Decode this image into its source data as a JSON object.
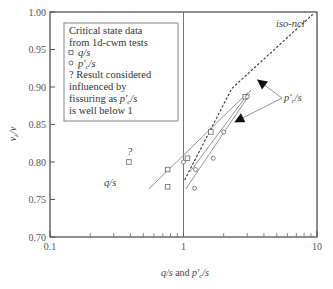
{
  "chart_data": {
    "type": "scatter",
    "title": "",
    "xlabel": "q/s and p'c/s",
    "ylabel": "vλ/v",
    "xscale": "log",
    "xlim": [
      0.1,
      10
    ],
    "ylim": [
      0.7,
      1.0
    ],
    "x_ticks": [
      {
        "value": 0.1,
        "label": "0.1"
      },
      {
        "value": 1,
        "label": "1"
      },
      {
        "value": 10,
        "label": "10"
      }
    ],
    "y_ticks": [
      {
        "value": 0.7,
        "label": "0.70"
      },
      {
        "value": 0.75,
        "label": "0.75"
      },
      {
        "value": 0.8,
        "label": "0.80"
      },
      {
        "value": 0.85,
        "label": "0.85"
      },
      {
        "value": 0.9,
        "label": "0.90"
      },
      {
        "value": 0.95,
        "label": "0.95"
      },
      {
        "value": 1.0,
        "label": "1.00"
      }
    ],
    "grid": false,
    "reference_lines": [
      {
        "axis": "x",
        "value": 1
      }
    ],
    "series": [
      {
        "name": "q/s",
        "marker": "square",
        "points": [
          {
            "x": 0.39,
            "y": 0.8,
            "flag": "?"
          },
          {
            "x": 0.76,
            "y": 0.79
          },
          {
            "x": 0.76,
            "y": 0.767
          },
          {
            "x": 1.07,
            "y": 0.805
          },
          {
            "x": 1.6,
            "y": 0.84
          },
          {
            "x": 2.9,
            "y": 0.887
          }
        ]
      },
      {
        "name": "p'c/s",
        "marker": "circle",
        "points": [
          {
            "x": 1.0,
            "y": 0.8
          },
          {
            "x": 1.23,
            "y": 0.79
          },
          {
            "x": 1.21,
            "y": 0.765
          },
          {
            "x": 1.67,
            "y": 0.805
          },
          {
            "x": 2.0,
            "y": 0.84
          },
          {
            "x": 3.0,
            "y": 0.887
          }
        ]
      }
    ],
    "lines": [
      {
        "name": "q/s fit",
        "style": "solid",
        "points": [
          {
            "x": 0.55,
            "y": 0.764
          },
          {
            "x": 3.05,
            "y": 0.893
          }
        ]
      },
      {
        "name": "p'c/s fit",
        "style": "solid",
        "points": [
          {
            "x": 1.04,
            "y": 0.764
          },
          {
            "x": 3.15,
            "y": 0.891
          }
        ]
      },
      {
        "name": "p'c/s fit 2",
        "style": "solid",
        "points": [
          {
            "x": 1.12,
            "y": 0.787
          },
          {
            "x": 3.2,
            "y": 0.896
          }
        ]
      },
      {
        "name": "iso-ncl",
        "style": "dashed",
        "points": [
          {
            "x": 1.02,
            "y": 0.776
          },
          {
            "x": 2.3,
            "y": 0.898
          },
          {
            "x": 9.3,
            "y": 0.997
          }
        ]
      }
    ],
    "annotations": [
      {
        "text": "iso-ncl",
        "x": 5.0,
        "y": 0.975
      },
      {
        "text": "q/s",
        "x": 0.46,
        "y": 0.778
      },
      {
        "text": "?",
        "x": 0.39,
        "y": 0.812
      },
      {
        "text": "p'c/s",
        "x": 5.6,
        "y": 0.879,
        "arrows_to": [
          {
            "x": 3.55,
            "y": 0.91
          },
          {
            "x": 2.4,
            "y": 0.853
          }
        ]
      }
    ],
    "legend": {
      "placement": "top-left",
      "lines": [
        "Critical state data",
        "from 1d-cwm tests",
        "q/s",
        "p'c/s",
        "? Result considered",
        "influenced by",
        "fissuring as p'c/s",
        "is well below 1"
      ],
      "markers": [
        "square",
        "circle"
      ]
    }
  },
  "labels": {
    "ylabel_v": "v",
    "ylabel_sub": "λ",
    "ylabel_rest": "/v",
    "xlabel_a": "q/s",
    "xlabel_and": " and ",
    "xlabel_p": "p'",
    "xlabel_sub": "c",
    "xlabel_tail": "/s",
    "iso_ncl": "iso-ncl",
    "qs": "q/s",
    "question": "?",
    "pc_p": "p'",
    "pc_sub": "c",
    "pc_tail": "/s"
  },
  "legend": {
    "line1": "Critical state data",
    "line2": "from 1d-cwm tests",
    "item_q": "q/s",
    "item_p": "p'",
    "item_p_sub": "c",
    "item_p_tail": "/s",
    "line5": "? Result considered",
    "line6": "influenced by",
    "line7a": "fissuring as ",
    "line7b": "p'",
    "line7sub": "c",
    "line7c": "/s",
    "line8": "is well below 1"
  }
}
